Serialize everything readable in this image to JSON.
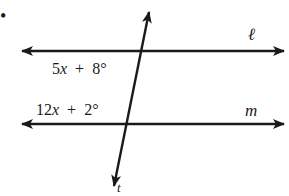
{
  "diagram": {
    "bullet": "•",
    "lines": {
      "l": {
        "label": "ℓ"
      },
      "m": {
        "label": "m"
      },
      "t": {
        "label": "t"
      }
    },
    "angles": {
      "top": {
        "coef": "5",
        "var": "x",
        "op": "+",
        "const": "8°"
      },
      "bottom": {
        "coef": "12",
        "var": "x",
        "op": "+",
        "const": "2°"
      }
    },
    "colors": {
      "stroke": "#1a1a1a",
      "background": "#ffffff"
    }
  }
}
